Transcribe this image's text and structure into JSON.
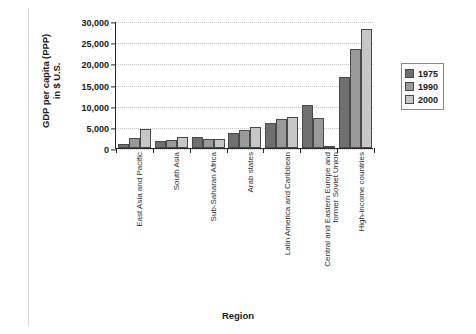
{
  "chart_data": {
    "type": "bar",
    "title": "",
    "xlabel": "Region",
    "ylabel": "GDP per capita (PPP) in $ U.S.",
    "ylabel_line1": "GDP per capita (PPP)",
    "ylabel_line2": "in $ U.S.",
    "ylim": [
      0,
      30000
    ],
    "ytick_values": [
      0,
      5000,
      10000,
      15000,
      20000,
      25000,
      30000
    ],
    "ytick_labels": [
      "0",
      "5,000",
      "10,000",
      "15,000",
      "20,000",
      "25,000",
      "30,000"
    ],
    "grid": true,
    "legend_position": "right",
    "categories": [
      "East Asia and Pacific",
      "South Asia",
      "Sub-Saharan Africa",
      "Arab states",
      "Latin America and Caribbean",
      "Central and Eastern Europe and former Soviet Union",
      "High-income countries"
    ],
    "category_lines": [
      [
        "East Asia and Pacific"
      ],
      [
        "South Asia"
      ],
      [
        "Sub-Saharan Africa"
      ],
      [
        "Arab states"
      ],
      [
        "Latin America and Caribbean"
      ],
      [
        "Central and Eastern Europe and",
        "former Soviet Union"
      ],
      [
        "High-income countries"
      ]
    ],
    "series": [
      {
        "name": "1975",
        "color": "#6f6f6f",
        "values": [
          1000,
          1700,
          2600,
          3500,
          6000,
          10200,
          16800
        ]
      },
      {
        "name": "1990",
        "color": "#9a9a9a",
        "values": [
          2400,
          2000,
          2200,
          4200,
          6800,
          7000,
          23500
        ]
      },
      {
        "name": "2000",
        "color": "#c7c7c7",
        "values": [
          4500,
          2500,
          2200,
          5000,
          7400,
          200,
          28000
        ]
      }
    ]
  },
  "legend": {
    "entries": [
      {
        "label": "1975"
      },
      {
        "label": "1990"
      },
      {
        "label": "2000"
      }
    ]
  },
  "colors": {
    "series_1975": "#6f6f6f",
    "series_1990": "#9a9a9a",
    "series_2000": "#c7c7c7",
    "axis": "#2a2a2a",
    "grid": "#c9c9c9",
    "background": "#ffffff"
  }
}
